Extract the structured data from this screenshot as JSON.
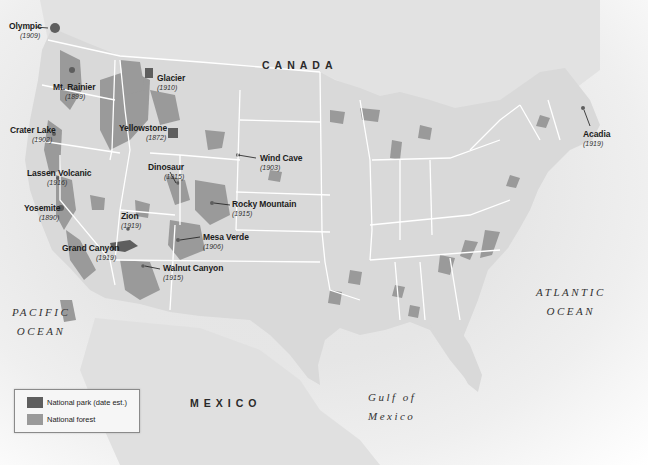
{
  "map": {
    "countries": [
      {
        "name": "CANADA",
        "x": 262,
        "y": 59
      },
      {
        "name": "MEXICO",
        "x": 190,
        "y": 397
      }
    ],
    "oceans": [
      {
        "line1": "PACIFIC",
        "line2": "OCEAN",
        "x": 12,
        "y": 303
      },
      {
        "line1": "ATLANTIC",
        "line2": "OCEAN",
        "x": 536,
        "y": 283
      },
      {
        "line1": "Gulf of",
        "line2": "Mexico",
        "x": 368,
        "y": 388
      }
    ],
    "parks": [
      {
        "name": "Olympic",
        "year": "(1909)",
        "x": 9,
        "y": 22,
        "yx": 20,
        "yy": 32
      },
      {
        "name": "Mt. Rainier",
        "year": "(1899)",
        "x": 53,
        "y": 83,
        "yx": 65,
        "yy": 93
      },
      {
        "name": "Crater Lake",
        "year": "(1902)",
        "x": 10,
        "y": 126,
        "yx": 32,
        "yy": 136
      },
      {
        "name": "Glacier",
        "year": "(1910)",
        "x": 157,
        "y": 74,
        "yx": 157,
        "yy": 84
      },
      {
        "name": "Yellowstone",
        "year": "(1872)",
        "x": 119,
        "y": 124,
        "yx": 146,
        "yy": 134
      },
      {
        "name": "Lassen Volcanic",
        "year": "(1916)",
        "x": 27,
        "y": 169,
        "yx": 47,
        "yy": 179
      },
      {
        "name": "Yosemite",
        "year": "(1890)",
        "x": 24,
        "y": 204,
        "yx": 39,
        "yy": 214
      },
      {
        "name": "Dinosaur",
        "year": "(1915)",
        "x": 148,
        "y": 163,
        "yx": 164,
        "yy": 173
      },
      {
        "name": "Wind Cave",
        "year": "(1903)",
        "x": 260,
        "y": 154,
        "yx": 260,
        "yy": 164
      },
      {
        "name": "Rocky Mountain",
        "year": "(1915)",
        "x": 232,
        "y": 200,
        "yx": 232,
        "yy": 210
      },
      {
        "name": "Zion",
        "year": "(1919)",
        "x": 121,
        "y": 212,
        "yx": 121,
        "yy": 222
      },
      {
        "name": "Mesa Verde",
        "year": "(1906)",
        "x": 203,
        "y": 233,
        "yx": 203,
        "yy": 243
      },
      {
        "name": "Grand Canyon",
        "year": "(1919)",
        "x": 62,
        "y": 244,
        "yx": 96,
        "yy": 254
      },
      {
        "name": "Walnut Canyon",
        "year": "(1915)",
        "x": 163,
        "y": 264,
        "yx": 163,
        "yy": 274
      },
      {
        "name": "Acadia",
        "year": "(1919)",
        "x": 583,
        "y": 130,
        "yx": 583,
        "yy": 140
      }
    ]
  },
  "legend": {
    "items": [
      {
        "label": "National park (date est.)",
        "color": "#5e5e5e"
      },
      {
        "label": "National forest",
        "color": "#9a9a9a"
      }
    ]
  },
  "colors": {
    "land": "#d9d9d9",
    "forest": "#9a9a9a",
    "park": "#5e5e5e",
    "borders": "#ffffff",
    "water": "#f4f4f4"
  }
}
